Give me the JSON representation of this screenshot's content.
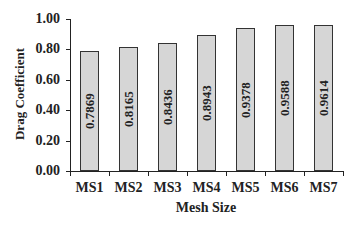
{
  "chart_data": {
    "type": "bar",
    "title": "",
    "xlabel": "Mesh Size",
    "ylabel": "Drag Coefficient",
    "categories": [
      "MS1",
      "MS2",
      "MS3",
      "MS4",
      "MS5",
      "MS6",
      "MS7"
    ],
    "values": [
      0.7869,
      0.8165,
      0.8436,
      0.8943,
      0.9378,
      0.9588,
      0.9614
    ],
    "value_labels": [
      "0.7869",
      "0.8165",
      "0.8436",
      "0.8943",
      "0.9378",
      "0.9588",
      "0.9614"
    ],
    "ylim": [
      0,
      1.0
    ],
    "yticks": [
      "0.00",
      "0.20",
      "0.40",
      "0.60",
      "0.80",
      "1.00"
    ],
    "grid": false,
    "legend": null,
    "bar_color": "#d6d6d6"
  }
}
